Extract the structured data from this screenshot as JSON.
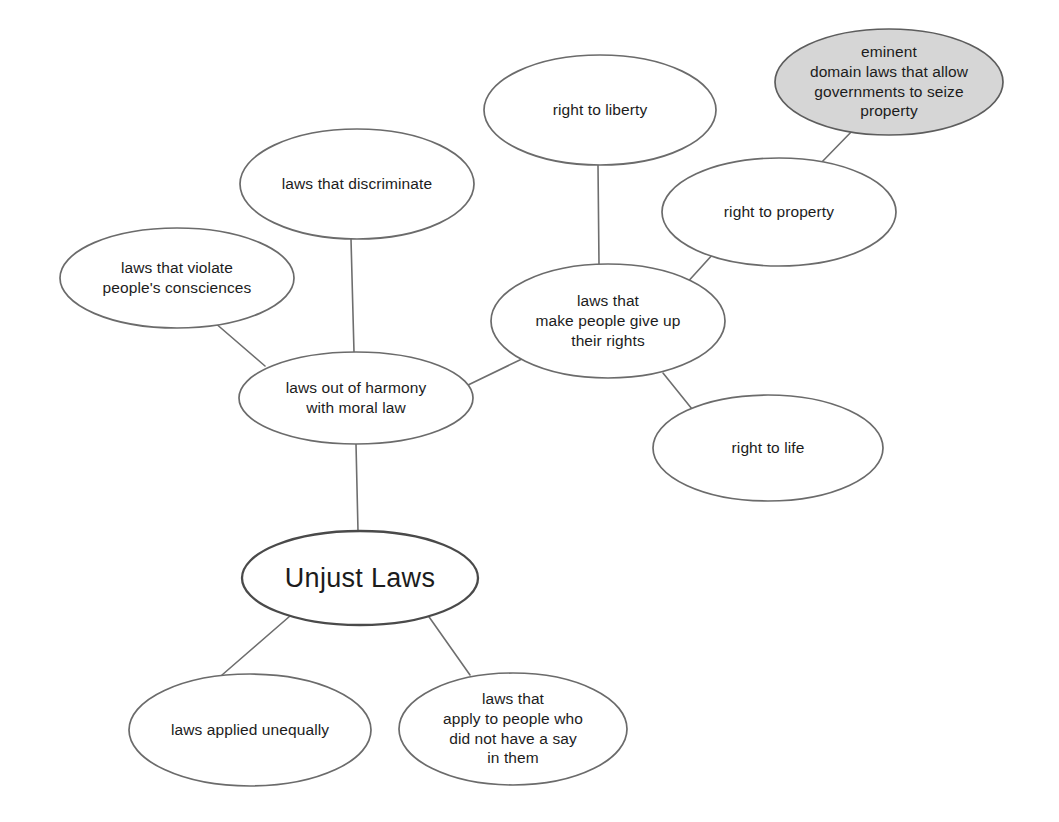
{
  "diagram": {
    "background_color": "#ffffff",
    "edge_color": "#6e6e6e",
    "node_stroke_color": "#6b6b6b",
    "node_fill_color": "#ffffff",
    "shaded_fill_color": "#d6d6d6",
    "text_color": "#1c1c1c"
  },
  "nodes": [
    {
      "id": "unjust-laws",
      "label": "Unjust Laws",
      "cx": 360,
      "cy": 578,
      "rx": 118,
      "ry": 47,
      "style": "root",
      "shaded": false
    },
    {
      "id": "laws-out-of-harmony",
      "label": "laws out of harmony\nwith moral law",
      "cx": 356,
      "cy": 398,
      "rx": 117,
      "ry": 46,
      "style": "normal",
      "shaded": false
    },
    {
      "id": "laws-that-discriminate",
      "label": "laws that discriminate",
      "cx": 357,
      "cy": 184,
      "rx": 117,
      "ry": 55,
      "style": "normal",
      "shaded": false
    },
    {
      "id": "laws-that-violate-consciences",
      "label": "laws that violate\npeople's consciences",
      "cx": 177,
      "cy": 278,
      "rx": 117,
      "ry": 50,
      "style": "normal",
      "shaded": false
    },
    {
      "id": "laws-give-up-rights",
      "label": "laws that\nmake people give up\ntheir rights",
      "cx": 608,
      "cy": 321,
      "rx": 117,
      "ry": 57,
      "style": "normal",
      "shaded": false
    },
    {
      "id": "right-to-liberty",
      "label": "right to liberty",
      "cx": 600,
      "cy": 110,
      "rx": 116,
      "ry": 55,
      "style": "normal",
      "shaded": false
    },
    {
      "id": "right-to-property",
      "label": "right to property",
      "cx": 779,
      "cy": 212,
      "rx": 117,
      "ry": 54,
      "style": "normal",
      "shaded": false
    },
    {
      "id": "right-to-life",
      "label": "right to life",
      "cx": 768,
      "cy": 448,
      "rx": 115,
      "ry": 53,
      "style": "normal",
      "shaded": false
    },
    {
      "id": "eminent-domain-laws",
      "label": "eminent\ndomain laws that allow\ngovernments to seize\nproperty",
      "cx": 889,
      "cy": 82,
      "rx": 114,
      "ry": 53,
      "style": "normal",
      "shaded": true
    },
    {
      "id": "laws-applied-unequally",
      "label": "laws applied unequally",
      "cx": 250,
      "cy": 730,
      "rx": 121,
      "ry": 56,
      "style": "normal",
      "shaded": false
    },
    {
      "id": "laws-no-say",
      "label": "laws that\napply to people who\ndid not have a say\nin them",
      "cx": 513,
      "cy": 729,
      "rx": 114,
      "ry": 56,
      "style": "normal",
      "shaded": false
    }
  ],
  "edges": [
    {
      "id": "edge-unjust-to-harmony",
      "from": "unjust-laws",
      "to": "laws-out-of-harmony",
      "x1": 358,
      "y1": 531,
      "x2": 356,
      "y2": 444
    },
    {
      "id": "edge-unjust-to-unequally",
      "from": "unjust-laws",
      "to": "laws-applied-unequally",
      "x1": 290,
      "y1": 616,
      "x2": 222,
      "y2": 675
    },
    {
      "id": "edge-unjust-to-no-say",
      "from": "unjust-laws",
      "to": "laws-no-say",
      "x1": 427,
      "y1": 614,
      "x2": 470,
      "y2": 675
    },
    {
      "id": "edge-harmony-to-discriminate",
      "from": "laws-out-of-harmony",
      "to": "laws-that-discriminate",
      "x1": 354,
      "y1": 352,
      "x2": 351,
      "y2": 239
    },
    {
      "id": "edge-harmony-to-consciences",
      "from": "laws-out-of-harmony",
      "to": "laws-that-violate-consciences",
      "x1": 265,
      "y1": 366,
      "x2": 214,
      "y2": 322
    },
    {
      "id": "edge-harmony-to-give-up-rights",
      "from": "laws-out-of-harmony",
      "to": "laws-give-up-rights",
      "x1": 466,
      "y1": 386,
      "x2": 524,
      "y2": 358
    },
    {
      "id": "edge-give-up-rights-to-liberty",
      "from": "laws-give-up-rights",
      "to": "right-to-liberty",
      "x1": 599,
      "y1": 264,
      "x2": 598,
      "y2": 165
    },
    {
      "id": "edge-give-up-rights-to-property",
      "from": "laws-give-up-rights",
      "to": "right-to-property",
      "x1": 684,
      "y1": 286,
      "x2": 714,
      "y2": 253
    },
    {
      "id": "edge-give-up-rights-to-life",
      "from": "laws-give-up-rights",
      "to": "right-to-life",
      "x1": 663,
      "y1": 373,
      "x2": 692,
      "y2": 409
    },
    {
      "id": "edge-property-to-eminent-domain",
      "from": "right-to-property",
      "to": "eminent-domain-laws",
      "x1": 819,
      "y1": 165,
      "x2": 855,
      "y2": 128
    }
  ]
}
